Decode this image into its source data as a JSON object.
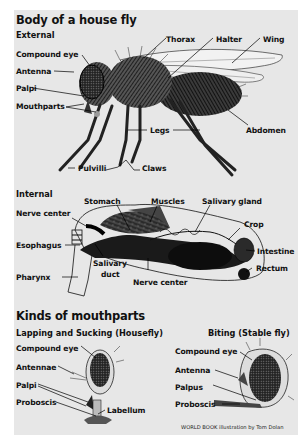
{
  "title": "Body of a house fly",
  "external": {
    "heading": "External",
    "labels": {
      "compound_eye": "Compound eye",
      "antenna": "Antenna",
      "palpi": "Palpi",
      "mouthparts": "Mouthparts",
      "thorax": "Thorax",
      "halter": "Halter",
      "wing": "Wing",
      "legs": "Legs",
      "abdomen": "Abdomen",
      "pulvilli": "Pulvilli",
      "claws": "Claws"
    }
  },
  "internal": {
    "heading": "Internal",
    "labels": {
      "stomach": "Stomach",
      "muscles": "Muscles",
      "salivary_gland": "Salivary gland",
      "nerve_center_top": "Nerve center",
      "crop": "Crop",
      "esophagus": "Esophagus",
      "intestine": "Intestine",
      "salivary_duct_1": "Salivary",
      "salivary_duct_2": "duct",
      "rectum": "Rectum",
      "pharynx": "Pharynx",
      "nerve_center_bottom": "Nerve center"
    }
  },
  "mouthparts": {
    "heading": "Kinds of mouthparts",
    "lapping": {
      "heading_bold": "Lapping and Sucking",
      "heading_paren": "(Housefly)",
      "labels": {
        "compound_eye": "Compound eye",
        "antennae": "Antennae",
        "palpi": "Palpi",
        "proboscis": "Proboscis",
        "labellum": "Labellum"
      }
    },
    "biting": {
      "heading_bold": "Biting",
      "heading_paren": "(Stable fly)",
      "labels": {
        "compound_eye": "Compound eye",
        "antenna": "Antenna",
        "palpus": "Palpus",
        "proboscis": "Proboscis"
      }
    }
  },
  "credit": "WORLD BOOK illustration by Tom Dolan",
  "colors": {
    "background": "#ffffff",
    "panel": "#e7e7e7",
    "ink": "#111111"
  }
}
